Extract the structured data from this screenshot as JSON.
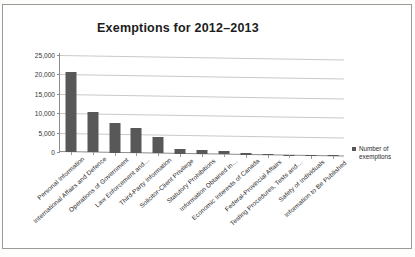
{
  "chart_data": {
    "type": "bar",
    "title": "Exemptions for 2012–2013",
    "xlabel": "",
    "ylabel": "",
    "ylim": [
      0,
      25000
    ],
    "yticks": [
      "0",
      "5,000",
      "10,000",
      "15,000",
      "20,000",
      "25,000"
    ],
    "ytick_values": [
      0,
      5000,
      10000,
      15000,
      20000,
      25000
    ],
    "grid": true,
    "legend_position": "right",
    "legend": [
      "Number of exemptions"
    ],
    "bar_color": "#585858",
    "categories": [
      "Personal Information",
      "International Affairs and Defence",
      "Operations of Government",
      "Law Enforcement and…",
      "Third-Party Information",
      "Solicitor-Client Privilege",
      "Statutory Prohibitions",
      "Information Obtained in…",
      "Economic Interests of Canada",
      "Federal-Provincial Affairs",
      "Testing Procedures, Tests and…",
      "Safety of Individuals",
      "Information to Be Published"
    ],
    "series": [
      {
        "name": "Number of exemptions",
        "values": [
          20700,
          10400,
          7600,
          6500,
          4300,
          1300,
          900,
          900,
          400,
          200,
          100,
          50,
          30
        ]
      }
    ]
  },
  "legend": {
    "marker": "square-marker",
    "label": "Number of exemptions"
  }
}
